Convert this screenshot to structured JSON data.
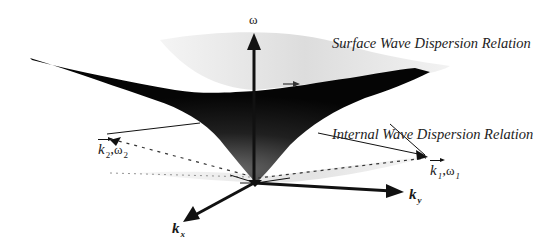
{
  "figure": {
    "type": "3D dispersion surface diagram",
    "labels": {
      "omega_axis": "ω",
      "ky_axis": "k",
      "ky_sub": "y",
      "kx_axis": "k",
      "kx_sub": "x",
      "surface_caption": "Surface Wave Dispersion Relation",
      "internal_caption": "Internal Wave Dispersion Relation",
      "wave1_k": "k",
      "wave1_k_sub": "1",
      "wave1_sep": ",",
      "wave1_omega": "ω",
      "wave1_omega_sub": "1",
      "wave2_k": "k",
      "wave2_k_sub": "2",
      "wave2_sep": ",",
      "wave2_omega": "ω",
      "wave2_omega_sub": "2"
    },
    "colors": {
      "surface_dark": "#0a0a0a",
      "surface_light": "#d9d9d9",
      "lines": "#111111"
    }
  }
}
